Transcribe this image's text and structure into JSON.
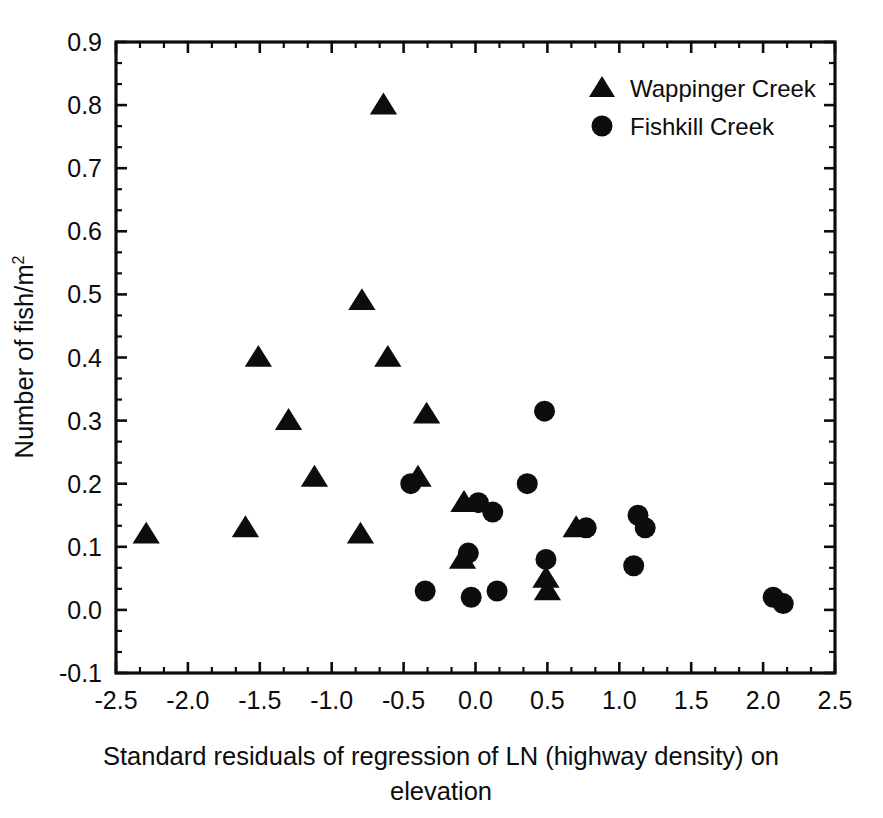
{
  "chart_data": {
    "type": "scatter",
    "title": "",
    "xlabel_line1": "Standard residuals of regression of LN (highway density) on",
    "xlabel_line2": "elevation",
    "ylabel_main": "Number of fish/m",
    "ylabel_sup": "2",
    "xlim": [
      -2.5,
      2.5
    ],
    "ylim": [
      -0.1,
      0.9
    ],
    "xticks": [
      "-2.5",
      "-2.0",
      "-1.5",
      "-1.0",
      "-0.5",
      "0.0",
      "0.5",
      "1.0",
      "1.5",
      "2.0",
      "2.5"
    ],
    "xtick_values": [
      -2.5,
      -2.0,
      -1.5,
      -1.0,
      -0.5,
      0.0,
      0.5,
      1.0,
      1.5,
      2.0,
      2.5
    ],
    "yticks": [
      "-0.1",
      "0.0",
      "0.1",
      "0.2",
      "0.3",
      "0.4",
      "0.5",
      "0.6",
      "0.7",
      "0.8",
      "0.9"
    ],
    "ytick_values": [
      -0.1,
      0.0,
      0.1,
      0.2,
      0.3,
      0.4,
      0.5,
      0.6,
      0.7,
      0.8,
      0.9
    ],
    "x_minor_per_major": 2,
    "y_minor_per_major": 2,
    "grid": false,
    "legend_position": "top-right",
    "marker_color": "#0d0d0d",
    "series": [
      {
        "name": "Wappinger Creek",
        "marker": "triangle",
        "points": [
          [
            -2.29,
            0.12
          ],
          [
            -1.6,
            0.13
          ],
          [
            -1.51,
            0.4
          ],
          [
            -1.3,
            0.3
          ],
          [
            -1.12,
            0.21
          ],
          [
            -0.8,
            0.12
          ],
          [
            -0.79,
            0.49
          ],
          [
            -0.64,
            0.8
          ],
          [
            -0.61,
            0.4
          ],
          [
            -0.4,
            0.21
          ],
          [
            -0.34,
            0.31
          ],
          [
            -0.09,
            0.08
          ],
          [
            -0.08,
            0.17
          ],
          [
            0.49,
            0.05
          ],
          [
            0.5,
            0.03
          ],
          [
            0.7,
            0.13
          ]
        ]
      },
      {
        "name": "Fishkill Creek",
        "marker": "circle",
        "points": [
          [
            -0.45,
            0.2
          ],
          [
            -0.35,
            0.03
          ],
          [
            -0.05,
            0.09
          ],
          [
            -0.03,
            0.02
          ],
          [
            0.02,
            0.17
          ],
          [
            0.12,
            0.155
          ],
          [
            0.15,
            0.03
          ],
          [
            0.36,
            0.2
          ],
          [
            0.48,
            0.315
          ],
          [
            0.49,
            0.08
          ],
          [
            0.77,
            0.13
          ],
          [
            1.1,
            0.07
          ],
          [
            1.13,
            0.15
          ],
          [
            1.18,
            0.13
          ],
          [
            2.07,
            0.02
          ],
          [
            2.14,
            0.01
          ]
        ]
      }
    ],
    "legend": [
      {
        "label": "Wappinger Creek",
        "marker": "triangle"
      },
      {
        "label": "Fishkill Creek",
        "marker": "circle"
      }
    ]
  }
}
